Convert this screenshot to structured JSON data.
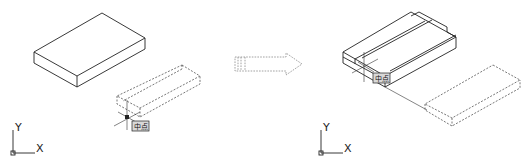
{
  "figure": {
    "left_panel": {
      "ucs": {
        "x_label": "X",
        "y_label": "Y"
      },
      "snap_tooltip": "中点"
    },
    "transition_arrow": {
      "style": "dashed",
      "direction": "right"
    },
    "right_panel": {
      "ucs": {
        "x_label": "X",
        "y_label": "Y"
      },
      "snap_tooltip": "中点"
    }
  },
  "colors": {
    "line": "#222222",
    "dashed": "#555555",
    "arrow": "#8a8a8a",
    "tooltip_bg": "#d8d8d8",
    "background": "#ffffff"
  }
}
